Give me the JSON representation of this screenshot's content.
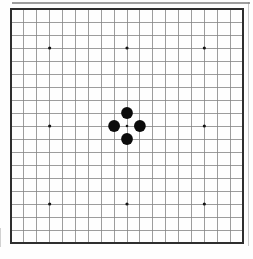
{
  "diagram": {
    "type": "go-board",
    "board_size": 19,
    "star_points": [
      [
        3,
        3
      ],
      [
        9,
        3
      ],
      [
        15,
        3
      ],
      [
        3,
        9
      ],
      [
        9,
        9
      ],
      [
        15,
        9
      ],
      [
        3,
        15
      ],
      [
        9,
        15
      ],
      [
        15,
        15
      ]
    ],
    "stones": [
      {
        "color": "black",
        "col": 9,
        "row": 8
      },
      {
        "color": "black",
        "col": 8,
        "row": 9
      },
      {
        "color": "black",
        "col": 10,
        "row": 9
      },
      {
        "color": "black",
        "col": 9,
        "row": 10
      }
    ],
    "colors": {
      "background": "#fefefe",
      "grid_line": "#858585",
      "board_border": "#2e2e2e",
      "stone_black": "#0b0b0b",
      "star_point": "#141414"
    }
  }
}
